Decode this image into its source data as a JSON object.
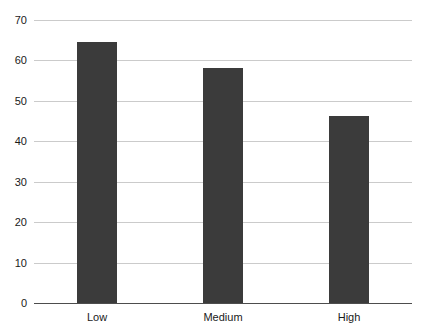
{
  "chart_data": {
    "type": "bar",
    "title": "",
    "subtitle": "",
    "xlabel": "",
    "ylabel": "",
    "categories": [
      "Low",
      "Medium",
      "High"
    ],
    "values": [
      64.5,
      58.2,
      46.3
    ],
    "ylim": [
      0,
      70
    ],
    "yticks": [
      0,
      10,
      20,
      30,
      40,
      50,
      60,
      70
    ],
    "ytick_labels": [
      "0",
      "10",
      "20",
      "30",
      "40",
      "50",
      "60",
      "70"
    ],
    "grid": true,
    "legend": false,
    "legend_position": "none",
    "bar_color": "#3b3b3b",
    "gridline_color": "#cbcbcb",
    "axis_color": "#4d4d4d",
    "background_color": "#ffffff",
    "bar_width_px": 40
  },
  "axes": {
    "y_axis_name": "y-axis",
    "x_axis_name": "x-axis"
  }
}
